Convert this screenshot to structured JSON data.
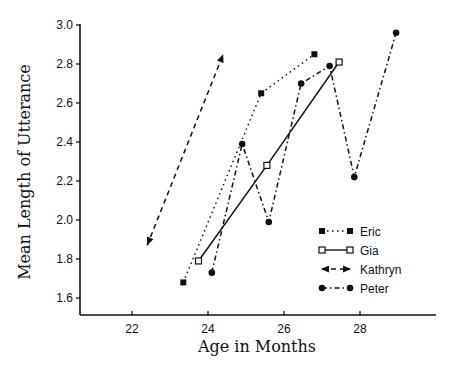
{
  "chart_data": {
    "type": "line",
    "title": "",
    "xlabel": "Age in Months",
    "ylabel": "Mean Length of Utterance",
    "xlim": [
      20.8,
      29.9
    ],
    "ylim": [
      1.51,
      3.0
    ],
    "xticks": [
      22,
      24,
      26,
      28
    ],
    "yticks": [
      1.6,
      1.8,
      2.0,
      2.2,
      2.4,
      2.6,
      2.8,
      3.0
    ],
    "ytick_labels": [
      "1.6",
      "1.8",
      "2.0",
      "2.2",
      "2.4",
      "2.6",
      "2.8",
      "3.0"
    ],
    "grid": false,
    "legend_position": "lower right",
    "series": [
      {
        "name": "Eric",
        "line": "dotted",
        "marker": "filled-square",
        "points": [
          [
            23.35,
            1.68
          ],
          [
            25.4,
            2.65
          ],
          [
            26.8,
            2.85
          ]
        ]
      },
      {
        "name": "Gia",
        "line": "solid",
        "marker": "open-square",
        "points": [
          [
            23.75,
            1.79
          ],
          [
            25.55,
            2.28
          ],
          [
            27.45,
            2.81
          ]
        ]
      },
      {
        "name": "Kathryn",
        "line": "dashed",
        "marker": "arrow",
        "points": [
          [
            22.4,
            1.87
          ],
          [
            24.4,
            2.85
          ]
        ]
      },
      {
        "name": "Peter",
        "line": "dash-dot",
        "marker": "filled-circle",
        "points": [
          [
            24.1,
            1.73
          ],
          [
            24.9,
            2.39
          ],
          [
            25.6,
            1.99
          ],
          [
            26.45,
            2.7
          ],
          [
            27.2,
            2.79
          ],
          [
            27.85,
            2.22
          ],
          [
            28.95,
            2.96
          ]
        ]
      }
    ]
  },
  "legend": {
    "items": [
      "Eric",
      "Gia",
      "Kathryn",
      "Peter"
    ]
  }
}
